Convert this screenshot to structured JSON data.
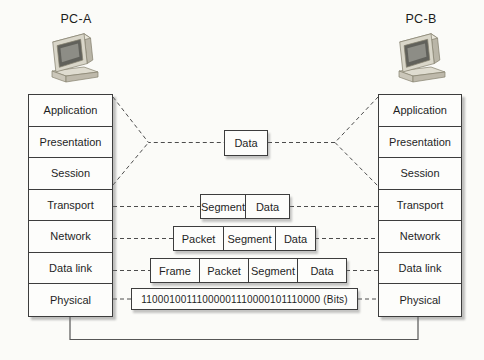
{
  "palette": {
    "ink": "#3d3d3d",
    "dash_line": "#4c4c4c",
    "text": "#1f1f1f",
    "paper": "#fbfbf8",
    "pc_body": "#d9d6c9",
    "pc_screen": "#61615b"
  },
  "hosts": {
    "left": {
      "label": "PC-A",
      "icon": "desktop-computer-icon"
    },
    "right": {
      "label": "PC-B",
      "icon": "desktop-computer-icon"
    }
  },
  "osi_layers": [
    "Application",
    "Presentation",
    "Session",
    "Transport",
    "Network",
    "Data link",
    "Physical"
  ],
  "encapsulation": {
    "presentation": {
      "boxes": [
        "Data"
      ]
    },
    "transport": {
      "boxes": [
        "Segment",
        "Data"
      ]
    },
    "network": {
      "boxes": [
        "Packet",
        "Segment",
        "Data"
      ]
    },
    "data_link": {
      "boxes": [
        "Frame",
        "Packet",
        "Segment",
        "Data"
      ]
    },
    "physical": {
      "bits": "11000100111000001110000101110000 (Bits)"
    }
  }
}
